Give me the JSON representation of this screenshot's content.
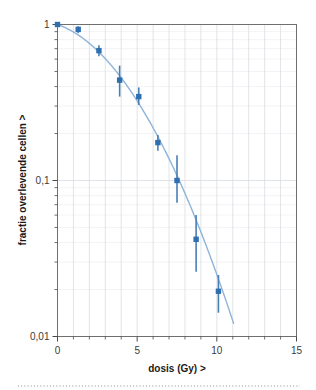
{
  "chart_data": {
    "type": "scatter",
    "title": "",
    "subtitle": "",
    "xlabel": "dosis (Gy) >",
    "ylabel": "fractie overlevende cellen >",
    "xlim": [
      0,
      15
    ],
    "ylim": [
      0.01,
      1
    ],
    "yscale": "log",
    "xscale": "linear",
    "grid": true,
    "legend": null,
    "legend_position": "none",
    "decimal_separator": ",",
    "xticks": [
      0,
      5,
      10,
      15
    ],
    "xtick_labels": [
      "0",
      "5",
      "10",
      "15"
    ],
    "yticks": [
      1,
      0.1,
      0.01
    ],
    "ytick_labels": [
      "1",
      "0,1",
      "0,01"
    ],
    "x_minor_tick_step": 1,
    "y_minor_decades": [
      [
        0.9,
        0.8,
        0.7,
        0.6,
        0.5,
        0.4,
        0.3,
        0.2
      ],
      [
        0.09,
        0.08,
        0.07,
        0.06,
        0.05,
        0.04,
        0.03,
        0.02
      ]
    ],
    "series": [
      {
        "name": "overlevingsfractie",
        "marker": "square",
        "marker_color": "#2f6fb0",
        "errorbar_color": "#4a7fb5",
        "x": [
          0.0,
          1.3,
          2.6,
          3.9,
          5.1,
          6.3,
          7.5,
          8.7,
          10.1
        ],
        "y": [
          1.0,
          0.93,
          0.68,
          0.44,
          0.345,
          0.175,
          0.1,
          0.042,
          0.0195
        ],
        "yerr_low": [
          1.0,
          0.88,
          0.625,
          0.345,
          0.305,
          0.155,
          0.072,
          0.026,
          0.0142
        ],
        "yerr_high": [
          1.0,
          0.975,
          0.735,
          0.545,
          0.395,
          0.196,
          0.145,
          0.06,
          0.0248
        ]
      }
    ],
    "fit_curve": {
      "name": "lineair-kwadratisch fit",
      "color": "#8fb4d9",
      "x_start": 0,
      "x_end": 11.05,
      "alpha": 0.082,
      "beta": 0.0287,
      "description": "gladde dalende overlevingscurve met schouder"
    },
    "annotations": []
  },
  "footer": {
    "divider_style": "dotted"
  }
}
